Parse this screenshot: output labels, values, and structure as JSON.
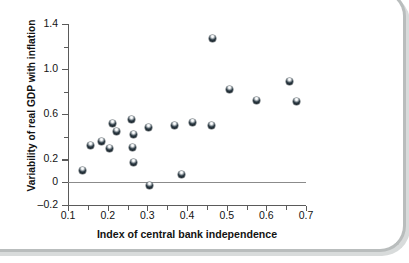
{
  "chart_data": {
    "type": "scatter",
    "title": "",
    "xlabel": "Index of central bank independence",
    "ylabel": "Variability of real GDP with inflation",
    "xlim": [
      0.1,
      0.7
    ],
    "ylim": [
      -0.2,
      1.4
    ],
    "grid": false,
    "legend": null,
    "x_ticks": [
      "0.1",
      "0.2",
      "0.3",
      "0.4",
      "0.5",
      "0.6",
      "0.7"
    ],
    "x_tick_values": [
      0.1,
      0.2,
      0.3,
      0.4,
      0.5,
      0.6,
      0.7
    ],
    "x_minor_tick_values": [
      0.15,
      0.25,
      0.35,
      0.45,
      0.55,
      0.65
    ],
    "y_ticks": [
      "1.4",
      "1.0",
      "0.6",
      "0.2",
      "0",
      "–0.2"
    ],
    "y_tick_values": [
      1.4,
      1.0,
      0.6,
      0.2,
      0.0,
      -0.2
    ],
    "y_minor_tick_values": [
      1.2,
      0.8,
      0.4
    ],
    "zero_reference_line": 0,
    "marker": "filled-circle-with-highlight",
    "marker_color": "#1b2a33",
    "points": [
      {
        "x": 0.137,
        "y": 0.1
      },
      {
        "x": 0.157,
        "y": 0.32
      },
      {
        "x": 0.184,
        "y": 0.36
      },
      {
        "x": 0.205,
        "y": 0.3
      },
      {
        "x": 0.213,
        "y": 0.52
      },
      {
        "x": 0.222,
        "y": 0.45
      },
      {
        "x": 0.261,
        "y": 0.55
      },
      {
        "x": 0.266,
        "y": 0.42
      },
      {
        "x": 0.263,
        "y": 0.31
      },
      {
        "x": 0.264,
        "y": 0.17
      },
      {
        "x": 0.305,
        "y": -0.03
      },
      {
        "x": 0.303,
        "y": 0.48
      },
      {
        "x": 0.368,
        "y": 0.5
      },
      {
        "x": 0.386,
        "y": 0.07
      },
      {
        "x": 0.414,
        "y": 0.53
      },
      {
        "x": 0.461,
        "y": 0.5
      },
      {
        "x": 0.463,
        "y": 1.27
      },
      {
        "x": 0.506,
        "y": 0.82
      },
      {
        "x": 0.576,
        "y": 0.72
      },
      {
        "x": 0.659,
        "y": 0.89
      },
      {
        "x": 0.676,
        "y": 0.71
      }
    ]
  },
  "axes": {
    "y_title": "Variability of real GDP with inflation",
    "x_title": "Index of central bank independence"
  }
}
